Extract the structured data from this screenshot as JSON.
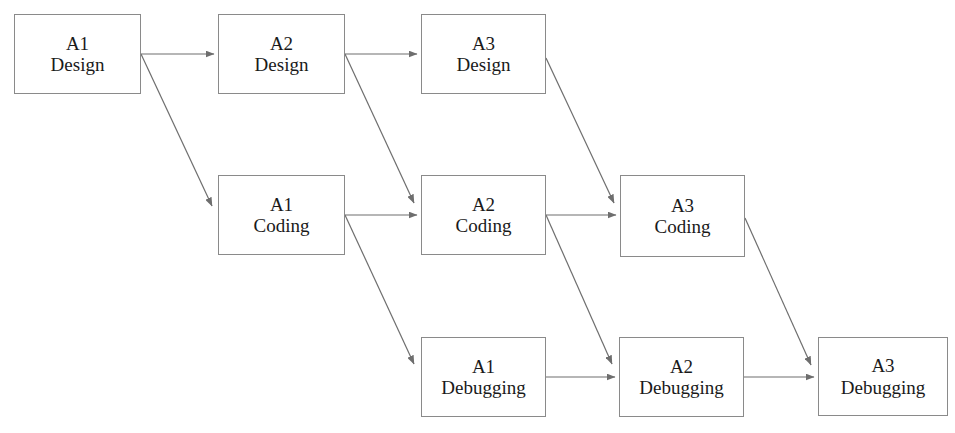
{
  "diagram": {
    "canvas": {
      "width": 955,
      "height": 433,
      "background": "#ffffff"
    },
    "style": {
      "box_border_color": "#8a8a8a",
      "box_fill_color": "#ffffff",
      "edge_color": "#6e6e6e",
      "text_color": "#1a1a1a"
    },
    "rows": [
      {
        "name": "design-row",
        "phase": "Design"
      },
      {
        "name": "coding-row",
        "phase": "Coding"
      },
      {
        "name": "debugging-row",
        "phase": "Debugging"
      }
    ],
    "nodes": [
      {
        "id": "a1-design",
        "line1": "A1",
        "line2": "Design",
        "x": 14,
        "y": 14,
        "w": 127,
        "h": 80
      },
      {
        "id": "a2-design",
        "line1": "A2",
        "line2": "Design",
        "x": 218,
        "y": 14,
        "w": 127,
        "h": 80
      },
      {
        "id": "a3-design",
        "line1": "A3",
        "line2": "Design",
        "x": 421,
        "y": 14,
        "w": 125,
        "h": 80
      },
      {
        "id": "a1-coding",
        "line1": "A1",
        "line2": "Coding",
        "x": 218,
        "y": 175,
        "w": 127,
        "h": 80
      },
      {
        "id": "a2-coding",
        "line1": "A2",
        "line2": "Coding",
        "x": 421,
        "y": 175,
        "w": 125,
        "h": 80
      },
      {
        "id": "a3-coding",
        "line1": "A3",
        "line2": "Coding",
        "x": 620,
        "y": 175,
        "w": 125,
        "h": 82
      },
      {
        "id": "a1-debugging",
        "line1": "A1",
        "line2": "Debugging",
        "x": 421,
        "y": 337,
        "w": 125,
        "h": 80
      },
      {
        "id": "a2-debugging",
        "line1": "A2",
        "line2": "Debugging",
        "x": 619,
        "y": 337,
        "w": 125,
        "h": 80
      },
      {
        "id": "a3-debugging",
        "line1": "A3",
        "line2": "Debugging",
        "x": 818,
        "y": 337,
        "w": 130,
        "h": 79
      }
    ],
    "edges": [
      {
        "id": "e-a1design-a2design",
        "from": "a1-design",
        "to": "a2-design",
        "kind": "horizontal",
        "x1": 141,
        "y1": 54,
        "x2": 214,
        "y2": 54
      },
      {
        "id": "e-a2design-a3design",
        "from": "a2-design",
        "to": "a3-design",
        "kind": "horizontal",
        "x1": 345,
        "y1": 54,
        "x2": 417,
        "y2": 54
      },
      {
        "id": "e-a1coding-a2coding",
        "from": "a1-coding",
        "to": "a2-coding",
        "kind": "horizontal",
        "x1": 345,
        "y1": 215,
        "x2": 417,
        "y2": 215
      },
      {
        "id": "e-a2coding-a3coding",
        "from": "a2-coding",
        "to": "a3-coding",
        "kind": "horizontal",
        "x1": 546,
        "y1": 215,
        "x2": 616,
        "y2": 215
      },
      {
        "id": "e-a1debug-a2debug",
        "from": "a1-debugging",
        "to": "a2-debugging",
        "kind": "horizontal",
        "x1": 546,
        "y1": 377,
        "x2": 615,
        "y2": 377
      },
      {
        "id": "e-a2debug-a3debug",
        "from": "a2-debugging",
        "to": "a3-debugging",
        "kind": "horizontal",
        "x1": 744,
        "y1": 377,
        "x2": 814,
        "y2": 377
      },
      {
        "id": "e-a1design-a1coding",
        "from": "a1-design",
        "to": "a1-coding",
        "kind": "diagonal",
        "x1": 141,
        "y1": 54,
        "x2": 212,
        "y2": 206
      },
      {
        "id": "e-a2design-a2coding",
        "from": "a2-design",
        "to": "a2-coding",
        "kind": "diagonal",
        "x1": 345,
        "y1": 54,
        "x2": 414,
        "y2": 203
      },
      {
        "id": "e-a3design-a3coding",
        "from": "a3-design",
        "to": "a3-coding",
        "kind": "diagonal",
        "x1": 546,
        "y1": 58,
        "x2": 614,
        "y2": 203
      },
      {
        "id": "e-a1coding-a1debug",
        "from": "a1-coding",
        "to": "a1-debugging",
        "kind": "diagonal",
        "x1": 345,
        "y1": 215,
        "x2": 414,
        "y2": 364
      },
      {
        "id": "e-a2coding-a2debug",
        "from": "a2-coding",
        "to": "a2-debugging",
        "kind": "diagonal",
        "x1": 546,
        "y1": 215,
        "x2": 612,
        "y2": 364
      },
      {
        "id": "e-a3coding-a3debug",
        "from": "a3-coding",
        "to": "a3-debugging",
        "kind": "diagonal",
        "x1": 745,
        "y1": 218,
        "x2": 811,
        "y2": 365
      }
    ]
  }
}
